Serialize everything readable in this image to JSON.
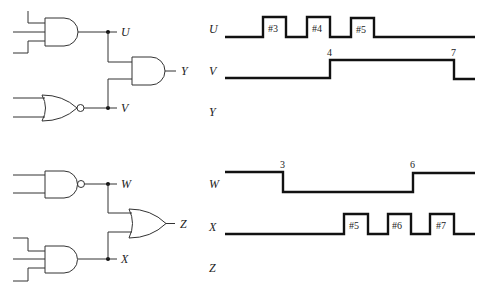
{
  "circuits": [
    {
      "name": "top-circuit",
      "gates": [
        {
          "type": "AND",
          "inputs": 3,
          "output": "U"
        },
        {
          "type": "NOR",
          "inputs": 2,
          "output": "V"
        },
        {
          "type": "AND",
          "inputs": [
            "U",
            "V"
          ],
          "output": "Y"
        }
      ],
      "labels": {
        "u": "U",
        "v": "V",
        "y": "Y"
      }
    },
    {
      "name": "bottom-circuit",
      "gates": [
        {
          "type": "NAND",
          "inputs": 2,
          "output": "W"
        },
        {
          "type": "AND",
          "inputs": 3,
          "output": "X"
        },
        {
          "type": "OR",
          "inputs": [
            "W",
            "X"
          ],
          "output": "Z"
        }
      ],
      "labels": {
        "w": "W",
        "x": "X",
        "z": "Z"
      }
    }
  ],
  "timing": {
    "top": {
      "U": {
        "label": "U",
        "initial": 0,
        "pulses": [
          {
            "label": "#3"
          },
          {
            "label": "#4"
          },
          {
            "label": "#5"
          }
        ]
      },
      "V": {
        "label": "V",
        "initial": 0,
        "transitions": [
          {
            "label": "4",
            "to": 1
          },
          {
            "label": "7",
            "to": 0
          }
        ]
      },
      "Y": {
        "label": "Y",
        "waveform": "blank (to be drawn)"
      }
    },
    "bottom": {
      "W": {
        "label": "W",
        "initial": 1,
        "transitions": [
          {
            "label": "3",
            "to": 0
          },
          {
            "label": "6",
            "to": 1
          }
        ]
      },
      "X": {
        "label": "X",
        "initial": 0,
        "pulses": [
          {
            "label": "#5"
          },
          {
            "label": "#6"
          },
          {
            "label": "#7"
          }
        ]
      },
      "Z": {
        "label": "Z",
        "waveform": "blank (to be drawn)"
      }
    }
  }
}
